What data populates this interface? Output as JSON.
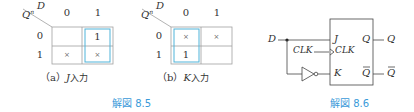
{
  "figure_8_5": {
    "caption": "解図 8.5",
    "kmap_a": {
      "corner_top": "D",
      "corner_left": "Q",
      "corner_left_sup": "n",
      "col_headers": [
        "0",
        "1"
      ],
      "row_headers": [
        "0",
        "1"
      ],
      "cells": [
        [
          "",
          "1"
        ],
        [
          "×",
          "×"
        ]
      ],
      "group": "column-1",
      "caption_prefix": "（a）",
      "caption_var": "J",
      "caption_suffix": "入力"
    },
    "kmap_b": {
      "corner_top": "D",
      "corner_left": "Q",
      "corner_left_sup": "n",
      "col_headers": [
        "0",
        "1"
      ],
      "row_headers": [
        "0",
        "1"
      ],
      "cells": [
        [
          "×",
          "×"
        ],
        [
          "1",
          ""
        ]
      ],
      "group": "column-0",
      "caption_prefix": "（b）",
      "caption_var": "K",
      "caption_suffix": "入力"
    }
  },
  "figure_8_6": {
    "caption": "解図 8.6",
    "input_d": "D",
    "input_clk": "CLK",
    "pin_j": "J",
    "pin_clk": "CLK",
    "pin_k": "K",
    "pin_q": "Q",
    "pin_qbar": "Q",
    "out_q": "Q",
    "out_qbar": "Q"
  },
  "colors": {
    "grid": "#999999",
    "group_highlight": "#4fb3d9",
    "caption": "#3a9ad9",
    "line": "#444444"
  }
}
